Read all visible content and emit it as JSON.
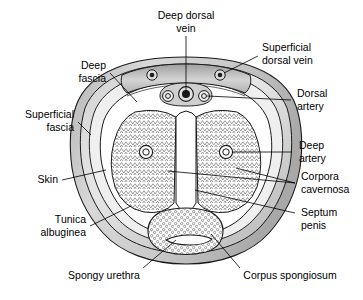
{
  "figure": {
    "background_color": "#ffffff",
    "line_color": "#000000",
    "shade_light": "#d9d9d9",
    "shade_mid": "#c4c4c4",
    "shade_dark": "#9a9a9a",
    "hatch_color": "#8c8c8c",
    "stipple_color": "#7d7d7d"
  },
  "labels": {
    "deep_dorsal_vein": {
      "line1": "Deep dorsal",
      "line2": "vein"
    },
    "superficial_dorsal_vein": {
      "line1": "Superficial",
      "line2": "dorsal vein"
    },
    "dorsal_artery": {
      "line1": "Dorsal",
      "line2": "artery"
    },
    "deep_artery": {
      "line1": "Deep",
      "line2": "artery"
    },
    "corpora_cavernosa": {
      "line1": "Corpora",
      "line2": "cavernosa"
    },
    "septum_penis": {
      "line1": "Septum",
      "line2": "penis"
    },
    "corpus_spongiosum": {
      "line1": "Corpus spongiosum"
    },
    "spongy_urethra": {
      "line1": "Spongy urethra"
    },
    "tunica_albuginea": {
      "line1": "Tunica",
      "line2": "albuginea"
    },
    "skin": {
      "line1": "Skin"
    },
    "superficial_fascia": {
      "line1": "Superficial",
      "line2": "fascia"
    },
    "deep_fascia": {
      "line1": "Deep",
      "line2": "fascia"
    }
  }
}
